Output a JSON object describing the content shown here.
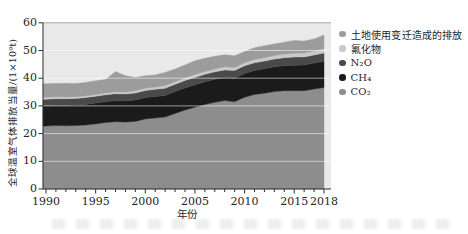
{
  "figure": {
    "ylabel": "全球温室气体排放当量/(1×10⁹t)",
    "xlabel": "年份"
  },
  "legend": {
    "items": [
      {
        "label": "土地使用变迁造成的排放",
        "series": "landuse"
      },
      {
        "label": "氟化物",
        "series": "fgas"
      },
      {
        "label": "N₂O",
        "series": "n2o"
      },
      {
        "label": "CH₄",
        "series": "ch4"
      },
      {
        "label": "CO₂",
        "series": "co2"
      }
    ]
  },
  "chart_data": {
    "type": "area",
    "stacked": true,
    "title": "",
    "xlabel": "年份",
    "ylabel": "全球温室气体排放当量/(1×10⁹t)",
    "ylim": [
      0,
      60
    ],
    "grid": "horizontal",
    "gridlines": [
      10,
      20,
      30,
      40,
      50
    ],
    "plot_bg": "#e9e9e9",
    "legend_position": "right-top",
    "x": [
      1990,
      1991,
      1992,
      1993,
      1994,
      1995,
      1996,
      1997,
      1998,
      1999,
      2000,
      2001,
      2002,
      2003,
      2004,
      2005,
      2006,
      2007,
      2008,
      2009,
      2010,
      2011,
      2012,
      2013,
      2014,
      2015,
      2016,
      2017,
      2018
    ],
    "x_ticks": [
      1990,
      1995,
      2000,
      2005,
      2010,
      2015,
      2018
    ],
    "y_ticks": [
      0,
      10,
      20,
      30,
      40,
      50,
      60
    ],
    "series": [
      {
        "key": "co2",
        "name": "CO₂",
        "color": "#8d8d8d",
        "values": [
          22.7,
          22.9,
          22.8,
          22.9,
          23.1,
          23.5,
          24.0,
          24.3,
          24.2,
          24.4,
          25.3,
          25.6,
          26.0,
          27.3,
          28.5,
          29.5,
          30.5,
          31.3,
          31.9,
          31.5,
          33.1,
          34.1,
          34.6,
          35.2,
          35.5,
          35.5,
          35.5,
          36.1,
          36.6
        ]
      },
      {
        "key": "ch4",
        "name": "CH₄",
        "color": "#1b1b1b",
        "values": [
          7.3,
          7.3,
          7.4,
          7.4,
          7.4,
          7.5,
          7.5,
          7.6,
          7.6,
          7.7,
          7.7,
          7.8,
          7.8,
          7.9,
          8.0,
          8.1,
          8.2,
          8.3,
          8.4,
          8.5,
          8.6,
          8.7,
          8.8,
          8.9,
          9.0,
          9.2,
          9.3,
          9.4,
          9.5
        ]
      },
      {
        "key": "n2o",
        "name": "N₂O",
        "color": "#4a4a4a",
        "values": [
          2.4,
          2.4,
          2.4,
          2.4,
          2.5,
          2.5,
          2.5,
          2.5,
          2.5,
          2.6,
          2.6,
          2.6,
          2.6,
          2.6,
          2.7,
          2.7,
          2.7,
          2.7,
          2.7,
          2.8,
          2.8,
          2.8,
          2.8,
          2.8,
          2.9,
          2.9,
          2.9,
          2.9,
          3.0
        ]
      },
      {
        "key": "fgas",
        "name": "氟化物",
        "color": "#c9c9c9",
        "values": [
          0.7,
          0.7,
          0.6,
          0.6,
          0.6,
          0.6,
          0.7,
          0.7,
          0.7,
          0.8,
          0.8,
          0.8,
          0.9,
          0.9,
          0.9,
          1.0,
          1.0,
          1.0,
          1.1,
          1.1,
          1.1,
          1.2,
          1.2,
          1.3,
          1.3,
          1.4,
          1.4,
          1.4,
          1.5
        ]
      },
      {
        "key": "landuse",
        "name": "土地使用变迁造成的排放",
        "color": "#9c9c9c",
        "values": [
          4.9,
          4.8,
          5.0,
          4.8,
          4.9,
          5.0,
          4.8,
          7.3,
          5.9,
          4.8,
          4.5,
          4.4,
          4.8,
          4.6,
          4.7,
          5.0,
          4.8,
          4.6,
          4.4,
          4.2,
          4.0,
          4.2,
          4.3,
          4.2,
          4.3,
          4.6,
          4.3,
          4.4,
          5.0
        ]
      }
    ]
  }
}
